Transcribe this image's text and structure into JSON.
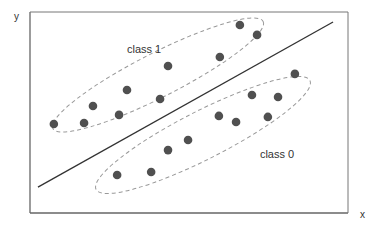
{
  "chart_data": {
    "type": "scatter",
    "title": "",
    "xlabel": "x",
    "ylabel": "y",
    "xlim": [
      0,
      100
    ],
    "ylim": [
      0,
      100
    ],
    "grid": false,
    "series": [
      {
        "name": "class 1",
        "color": "#505050",
        "points": [
          [
            7.5,
            44.3
          ],
          [
            17.0,
            44.8
          ],
          [
            19.8,
            53.2
          ],
          [
            28.0,
            48.8
          ],
          [
            30.5,
            61.2
          ],
          [
            40.9,
            56.7
          ],
          [
            43.4,
            73.1
          ],
          [
            59.7,
            77.6
          ],
          [
            66.0,
            93.5
          ],
          [
            71.4,
            88.6
          ]
        ]
      },
      {
        "name": "class 0",
        "color": "#505050",
        "points": [
          [
            27.4,
            18.9
          ],
          [
            38.1,
            20.4
          ],
          [
            43.4,
            31.3
          ],
          [
            49.7,
            36.3
          ],
          [
            59.4,
            48.3
          ],
          [
            64.8,
            45.3
          ],
          [
            69.8,
            58.7
          ],
          [
            74.8,
            47.8
          ],
          [
            78.0,
            57.7
          ],
          [
            83.3,
            69.2
          ]
        ]
      }
    ],
    "decision_boundary": {
      "from": [
        2.5,
        12.9
      ],
      "to": [
        95.3,
        95.0
      ],
      "color": "#333333"
    },
    "annotations": [
      {
        "text": "class 1",
        "at": [
          30.5,
          79.6
        ]
      },
      {
        "text": "class 0",
        "at": [
          72.3,
          27.4
        ]
      }
    ],
    "cluster_outline_color": "#999999"
  }
}
